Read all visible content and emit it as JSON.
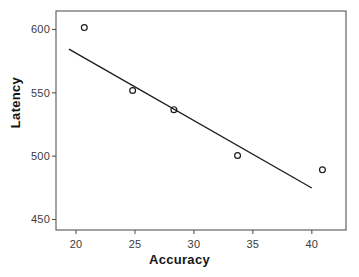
{
  "chart_data": {
    "type": "scatter",
    "title": "",
    "xlabel": "Accuracy",
    "ylabel": "Latency",
    "xlim": [
      18.3,
      42.9
    ],
    "ylim": [
      441.7,
      614.6
    ],
    "grid": false,
    "legend": null,
    "xticks": [
      20,
      25,
      30,
      35,
      40
    ],
    "xtick_labels": [
      "20",
      "25",
      "30",
      "35",
      "40"
    ],
    "yticks": [
      450,
      500,
      550,
      600
    ],
    "ytick_labels": [
      "450",
      "500",
      "550",
      "600"
    ],
    "marker": "open-circle",
    "marker_color": "#1a1a1a",
    "line_color": "#1a1a1a",
    "axis_color": "#555555",
    "background_color": "#ffffff",
    "points": [
      {
        "x": 20.7,
        "y": 601.5
      },
      {
        "x": 24.8,
        "y": 551.8
      },
      {
        "x": 28.3,
        "y": 536.7
      },
      {
        "x": 33.7,
        "y": 500.5
      },
      {
        "x": 40.9,
        "y": 489.2
      }
    ],
    "series": [
      {
        "name": "observations",
        "x": [
          20.7,
          24.8,
          28.3,
          33.7,
          40.9
        ],
        "values": [
          601.5,
          551.8,
          536.7,
          500.5,
          489.2
        ]
      }
    ],
    "trend_line": {
      "type": "linear-fit",
      "x_start": 19.4,
      "y_start": 584.5,
      "x_end": 40.0,
      "y_end": 474.9
    }
  },
  "axes": {
    "x_title": "Accuracy",
    "y_title": "Latency"
  }
}
